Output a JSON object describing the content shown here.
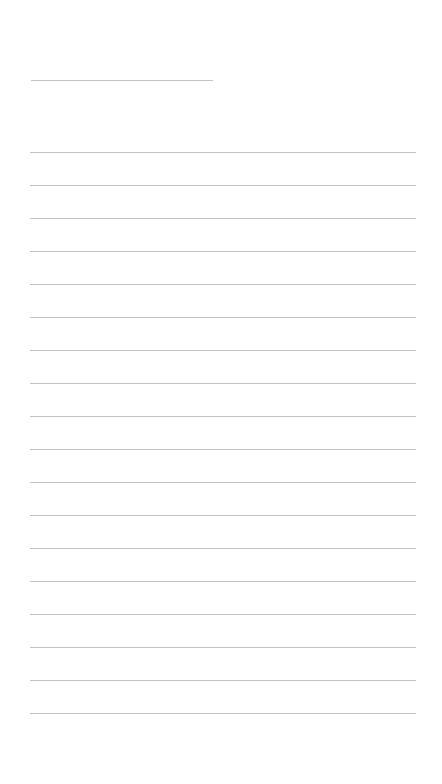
{
  "page": {
    "type": "ruled-notebook-page",
    "background": "#ffffff",
    "line_color": "#c2c2c2"
  },
  "title_line": {
    "text": "",
    "y": 80,
    "x_start": 31,
    "x_end": 213
  },
  "ruled_lines": {
    "count": 18,
    "first_y": 152,
    "spacing": 33,
    "x_start": 30,
    "x_end": 416,
    "entries": [
      "",
      "",
      "",
      "",
      "",
      "",
      "",
      "",
      "",
      "",
      "",
      "",
      "",
      "",
      "",
      "",
      "",
      ""
    ]
  }
}
